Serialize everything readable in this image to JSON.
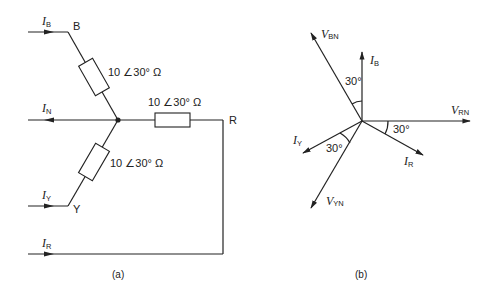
{
  "figure_a": {
    "caption": "(a)",
    "nodes": {
      "B": "B",
      "R": "R",
      "Y": "Y"
    },
    "currents": {
      "I_B": {
        "main": "I",
        "sub": "B"
      },
      "I_N": {
        "main": "I",
        "sub": "N"
      },
      "I_Y": {
        "main": "I",
        "sub": "Y"
      },
      "I_R": {
        "main": "I",
        "sub": "R"
      }
    },
    "impedances": {
      "B": "10 ∠30° Ω",
      "R": "10 ∠30° Ω",
      "Y": "10 ∠30° Ω"
    }
  },
  "figure_b": {
    "caption": "(b)",
    "phasors": {
      "V_BN": {
        "main": "V",
        "sub": "BN"
      },
      "I_B": {
        "main": "I",
        "sub": "B"
      },
      "V_RN": {
        "main": "V",
        "sub": "RN"
      },
      "I_R": {
        "main": "I",
        "sub": "R"
      },
      "I_Y": {
        "main": "I",
        "sub": "Y"
      },
      "V_YN": {
        "main": "V",
        "sub": "YN"
      }
    },
    "angles": {
      "B": "30°",
      "R": "30°",
      "Y": "30°"
    }
  }
}
